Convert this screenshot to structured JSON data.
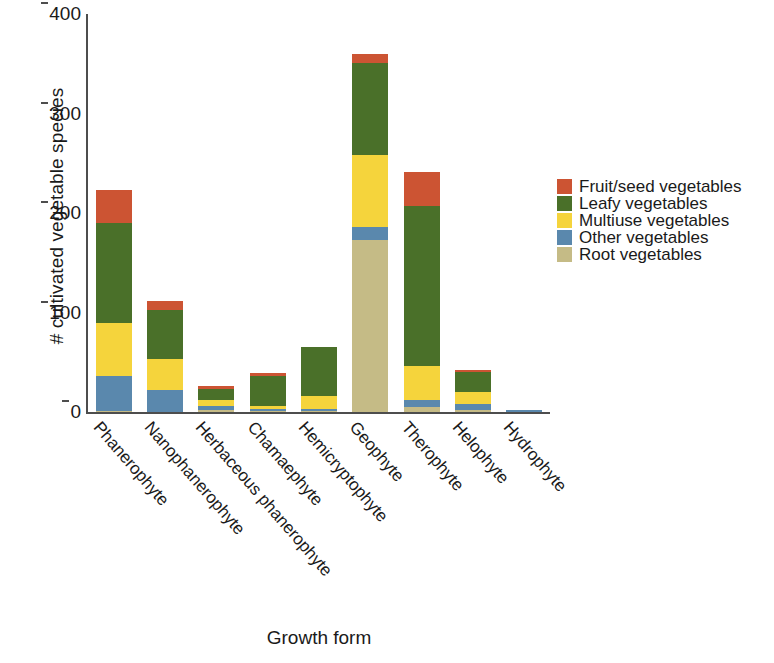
{
  "chart_data": {
    "type": "bar",
    "subtype": "stacked-bar",
    "title": "",
    "xlabel": "Growth form",
    "ylabel": "# cultivated vegetable species",
    "ylim": [
      0,
      400
    ],
    "yticks": [
      0,
      100,
      200,
      300,
      400
    ],
    "ytick_labels": [
      "0",
      "100",
      "200",
      "300",
      "400"
    ],
    "grid": false,
    "legend_position": "right",
    "categories": [
      "Phanerophyte",
      "Nanophanerophyte",
      "Herbaceous phanerophyte",
      "Chamaephyte",
      "Hemicryptophyte",
      "Geophyte",
      "Therophyte",
      "Helophyte",
      "Hydrophyte"
    ],
    "series": [
      {
        "name": "Root vegetables",
        "color": "#c5bb86",
        "values": [
          1,
          0,
          2,
          1,
          1,
          173,
          5,
          2,
          0
        ]
      },
      {
        "name": "Other vegetables",
        "color": "#5a88ad",
        "values": [
          35,
          22,
          4,
          2,
          2,
          13,
          7,
          6,
          2
        ]
      },
      {
        "name": "Multiuse vegetables",
        "color": "#f5d43c",
        "values": [
          53,
          31,
          6,
          3,
          13,
          72,
          34,
          12,
          0
        ]
      },
      {
        "name": "Leafy vegetables",
        "color": "#4a7029",
        "values": [
          101,
          50,
          11,
          30,
          49,
          93,
          161,
          20,
          0
        ]
      },
      {
        "name": "Fruit/seed vegetables",
        "color": "#cc5433",
        "values": [
          33,
          9,
          3,
          3,
          0,
          9,
          34,
          2,
          0
        ]
      }
    ],
    "totals": [
      223,
      112,
      26,
      39,
      65,
      360,
      241,
      42,
      2
    ],
    "legend_order": [
      "Fruit/seed vegetables",
      "Leafy vegetables",
      "Multiuse vegetables",
      "Other vegetables",
      "Root vegetables"
    ],
    "legend": [
      {
        "label": "Fruit/seed vegetables",
        "color": "#cc5433"
      },
      {
        "label": "Leafy vegetables",
        "color": "#4a7029"
      },
      {
        "label": "Multiuse vegetables",
        "color": "#f5d43c"
      },
      {
        "label": "Other vegetables",
        "color": "#5a88ad"
      },
      {
        "label": "Root vegetables",
        "color": "#c5bb86"
      }
    ]
  }
}
